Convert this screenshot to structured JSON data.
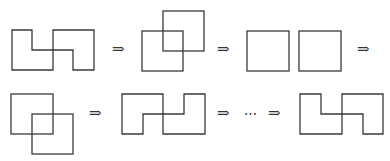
{
  "diagram": {
    "stroke_color": "#3a3a3a",
    "row1": {
      "steps": [
        {
          "name": "interlocking-l-shapes"
        },
        {
          "name": "overlapping-squares-up"
        },
        {
          "name": "separated-squares"
        }
      ],
      "arrows": [
        "⇒",
        "⇒",
        "⇒"
      ]
    },
    "row2": {
      "steps": [
        {
          "name": "overlapping-squares-down"
        },
        {
          "name": "interlocking-l-shapes"
        },
        {
          "name": "interlocking-l-shapes-final"
        }
      ],
      "arrows": [
        "⇒",
        "⇒",
        "⇒"
      ],
      "ellipsis": "⋯"
    }
  }
}
